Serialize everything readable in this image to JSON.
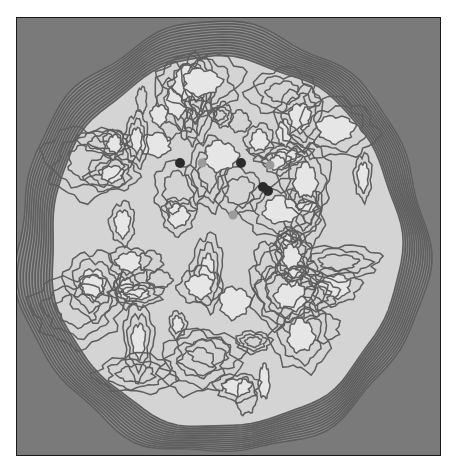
{
  "figure": {
    "background_color": "#7a7a7a",
    "contour_color": "#5e5e5e",
    "fill_light": "#d4d4d4",
    "fill_mid": "#a8a8a8",
    "frame_color": "#1a1a1a"
  },
  "chart_data": {
    "type": "heatmap",
    "subtype": "contour",
    "title": "",
    "xlabel": "",
    "ylabel": "",
    "grid": false,
    "legend": null,
    "particle": {
      "center": [
        220,
        240
      ],
      "outer_radius_x": 205,
      "outer_radius_y": 215,
      "inner_radius_x": 175,
      "inner_radius_y": 185
    },
    "markers": [
      {
        "x": 179,
        "y": 162,
        "shade": "dark"
      },
      {
        "x": 240,
        "y": 162,
        "shade": "dark"
      },
      {
        "x": 262,
        "y": 186,
        "shade": "dark"
      },
      {
        "x": 267,
        "y": 190,
        "shade": "dark"
      },
      {
        "x": 201,
        "y": 162,
        "shade": "grey"
      },
      {
        "x": 269,
        "y": 164,
        "shade": "grey"
      },
      {
        "x": 232,
        "y": 214,
        "shade": "grey"
      }
    ]
  }
}
